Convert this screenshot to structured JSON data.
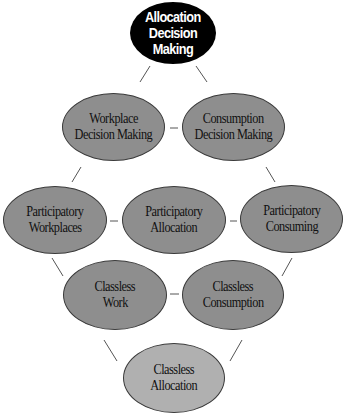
{
  "diagram": {
    "nodes": {
      "allocation_decision_making": {
        "line1": "Allocation",
        "line2": "Decision Making"
      },
      "workplace_decision_making": {
        "line1": "Workplace",
        "line2": "Decision Making"
      },
      "consumption_decision_making": {
        "line1": "Consumption",
        "line2": "Decision Making"
      },
      "participatory_workplaces": {
        "line1": "Participatory",
        "line2": "Workplaces"
      },
      "participatory_allocation": {
        "line1": "Participatory",
        "line2": "Allocation"
      },
      "participatory_consuming": {
        "line1": "Participatory",
        "line2": "Consuming"
      },
      "classless_work": {
        "line1": "Classless",
        "line2": "Work"
      },
      "classless_consumption": {
        "line1": "Classless",
        "line2": "Consumption"
      },
      "classless_allocation": {
        "line1": "Classless",
        "line2": "Allocation"
      }
    },
    "colors": {
      "top_node": "#000000",
      "mid_nodes": "#8e8e8e",
      "bottom_node": "#b0b0b0",
      "connector": "#555555"
    }
  }
}
